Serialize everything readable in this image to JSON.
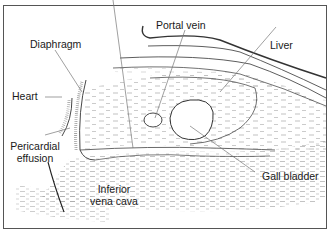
{
  "diagram": {
    "type": "anatomical-schematic",
    "labels": {
      "portal_vein": "Portal vein",
      "liver": "Liver",
      "diaphragm": "Diaphragm",
      "heart": "Heart",
      "pericardial_effusion_line1": "Pericardial",
      "pericardial_effusion_line2": "effusion",
      "ivc_line1": "Inferior",
      "ivc_line2": "vena cava",
      "gall_bladder": "Gall bladder"
    },
    "colors": {
      "line": "#333333",
      "leader": "#777777",
      "stipple": "#9a9a9a",
      "background": "#ffffff"
    }
  }
}
